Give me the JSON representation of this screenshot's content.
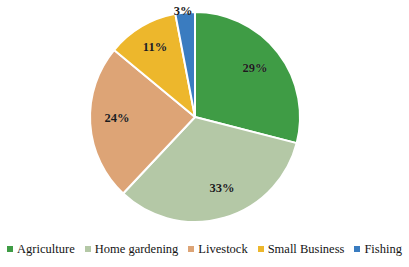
{
  "chart_data": {
    "type": "pie",
    "title": "",
    "xlabel": "",
    "ylabel": "",
    "categories": [
      "Agriculture",
      "Home gardening",
      "Livestock",
      "Small Business",
      "Fishing"
    ],
    "values": [
      29,
      33,
      24,
      11,
      3
    ],
    "data_labels": [
      "29%",
      "33%",
      "24%",
      "11%",
      "3%"
    ],
    "unit": "%",
    "start_angle_deg": 0,
    "direction": "clockwise",
    "grid": false,
    "legend_position": "bottom",
    "colors": [
      "#3f9c45",
      "#b4c8a6",
      "#dda476",
      "#edb72c",
      "#3a7cc0"
    ],
    "slice_border_color": "#ffffff",
    "background": "#ffffff"
  },
  "pie": {
    "center_x": 195,
    "center_y": 117,
    "radius": 105,
    "slices": [
      {
        "name": "Agriculture",
        "label": "29%",
        "value": 29,
        "color": "#3f9c45",
        "label_x": 255,
        "label_y": 68,
        "start": 0,
        "end": 104.4
      },
      {
        "name": "Home gardening",
        "label": "33%",
        "value": 33,
        "color": "#b4c8a6",
        "label_x": 222,
        "label_y": 188,
        "start": 104.4,
        "end": 223.2
      },
      {
        "name": "Livestock",
        "label": "24%",
        "value": 24,
        "color": "#dda476",
        "label_x": 117,
        "label_y": 118,
        "start": 223.2,
        "end": 309.6
      },
      {
        "name": "Small Business",
        "label": "11%",
        "value": 11,
        "color": "#edb72c",
        "label_x": 155,
        "label_y": 47,
        "start": 309.6,
        "end": 349.2
      },
      {
        "name": "Fishing",
        "label": "3%",
        "value": 3,
        "color": "#3a7cc0",
        "label_x": 183,
        "label_y": 11,
        "start": 349.2,
        "end": 360
      }
    ]
  },
  "legend": {
    "items": [
      {
        "label": "Agriculture",
        "color": "#3f9c45"
      },
      {
        "label": "Home gardening",
        "color": "#b4c8a6"
      },
      {
        "label": "Livestock",
        "color": "#dda476"
      },
      {
        "label": "Small Business",
        "color": "#edb72c"
      },
      {
        "label": "Fishing",
        "color": "#3a7cc0"
      }
    ]
  }
}
